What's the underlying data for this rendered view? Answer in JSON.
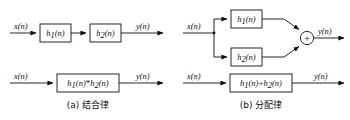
{
  "figure": {
    "background_color": "#ffffff",
    "line_color": "#111111",
    "panels": [
      {
        "id": "panel-a",
        "caption": "(a) 结合律",
        "rows": [
          {
            "id": "a-row-1",
            "input_label": "x(n)",
            "output_label": "y(n)",
            "blocks": [
              {
                "base": "h",
                "sub": "1",
                "arg": "(n)",
                "full": "h1(n)"
              },
              {
                "base": "h",
                "sub": "2",
                "arg": "(n)",
                "full": "h2(n)"
              }
            ]
          },
          {
            "id": "a-row-2",
            "input_label": "x(n)",
            "output_label": "y(n)",
            "operator": "*",
            "blocks": [
              {
                "base": "h",
                "sub": "1",
                "arg": "(n)",
                "full": "h1(n)*h2(n)"
              }
            ]
          }
        ]
      },
      {
        "id": "panel-b",
        "caption": "(b) 分配律",
        "summing_symbol": "+",
        "rows": [
          {
            "id": "b-row-1",
            "input_label": "x(n)",
            "output_label": "y(n)",
            "blocks": [
              {
                "base": "h",
                "sub": "1",
                "arg": "(n)",
                "full": "h1(n)"
              },
              {
                "base": "h",
                "sub": "2",
                "arg": "(n)",
                "full": "h2(n)"
              }
            ]
          },
          {
            "id": "b-row-2",
            "input_label": "x(n)",
            "output_label": "y(n)",
            "operator": "+",
            "blocks": [
              {
                "base": "h",
                "sub": "1",
                "arg": "(n)",
                "full": "h1(n)+h2(n)"
              }
            ]
          }
        ]
      }
    ],
    "symbols": {
      "var_x": "x",
      "var_y": "y",
      "var_h": "h",
      "arg": "(n)",
      "sub1": "1",
      "sub2": "2",
      "conv": "*",
      "sum": "+"
    }
  }
}
